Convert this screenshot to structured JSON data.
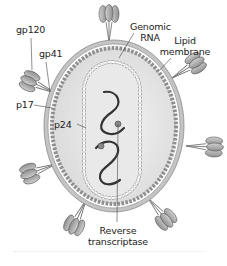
{
  "diagram": {
    "colors": {
      "interior": "#e6e6e6",
      "membrane": "#bdbdbd",
      "membrane_outline": "#8a8a8a",
      "matrix_beads": "#9a9a9a",
      "capsid_beads": "#ffffff",
      "rna": "#333333",
      "glycoprotein": "#a8a8a8"
    },
    "labels": {
      "gp120": "gp120",
      "gp41": "gp41",
      "p17": "p17",
      "p24": "p24",
      "genomic_rna_line1": "Genomic",
      "genomic_rna_line2": "RNA",
      "lipid_membrane_line1": "Lipid",
      "lipid_membrane_line2": "membrane",
      "reverse_transcriptase_line1": "Reverse",
      "reverse_transcriptase_line2": "transcriptase"
    }
  }
}
